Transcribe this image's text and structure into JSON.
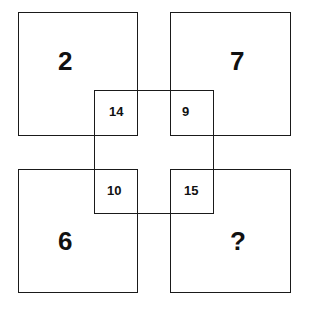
{
  "puzzle": {
    "corners": {
      "top_left": "2",
      "top_right": "7",
      "bottom_left": "6",
      "bottom_right": "?"
    },
    "overlaps": {
      "top_left": "14",
      "top_right": "9",
      "bottom_left": "10",
      "bottom_right": "15"
    }
  }
}
